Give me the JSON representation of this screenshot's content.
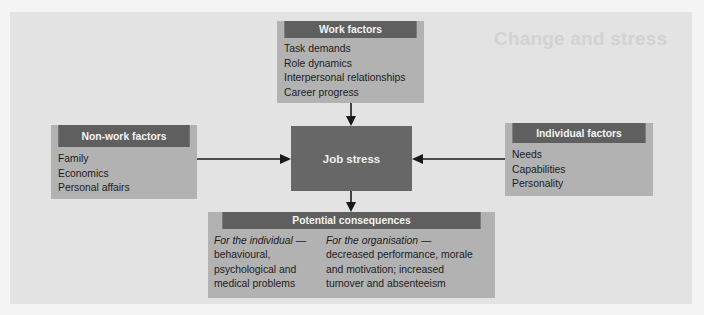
{
  "background": {
    "show_through_heading": "Change and stress"
  },
  "colors": {
    "header_fill": "#5f5f5f",
    "box_fill": "#b2b2b2",
    "center_fill": "#676767",
    "panel_fill": "#e3e3e3",
    "arrow": "#1a1a1a"
  },
  "diagram": {
    "work_factors": {
      "title": "Work factors",
      "items": [
        "Task demands",
        "Role dynamics",
        "Interpersonal relationships",
        "Career progress"
      ]
    },
    "non_work_factors": {
      "title": "Non-work factors",
      "items": [
        "Family",
        "Economics",
        "Personal affairs"
      ]
    },
    "individual_factors": {
      "title": "Individual factors",
      "items": [
        "Needs",
        "Capabilities",
        "Personality"
      ]
    },
    "center": {
      "title": "Job stress"
    },
    "consequences": {
      "title": "Potential consequences",
      "individual": {
        "label": "For the individual —",
        "lines": [
          "behavioural,",
          "psychological and",
          "medical problems"
        ]
      },
      "organisation": {
        "label": "For the organisation —",
        "lines": [
          "decreased performance, morale",
          "and motivation; increased",
          "turnover and absenteeism"
        ]
      }
    },
    "edges": [
      {
        "from": "Work factors",
        "to": "Job stress"
      },
      {
        "from": "Non-work factors",
        "to": "Job stress"
      },
      {
        "from": "Individual factors",
        "to": "Job stress"
      },
      {
        "from": "Job stress",
        "to": "Potential consequences"
      }
    ]
  }
}
